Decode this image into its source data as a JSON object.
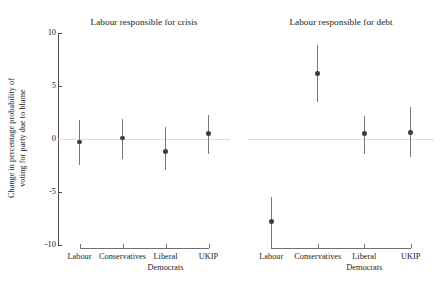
{
  "chart_data": {
    "type": "scatter",
    "title": "",
    "ylabel_lines": [
      "Change in percentage probability of",
      "voting for party due to blame"
    ],
    "ylabel": "Change in percentage probability of voting for party due to blame",
    "xlabel": "",
    "ylim": [
      -10,
      10
    ],
    "yticks": [
      10,
      5,
      0,
      -5,
      -10
    ],
    "ytick_labels": [
      "10",
      "5",
      "0",
      "-5",
      "-10"
    ],
    "grid": false,
    "legend": "none",
    "zero_reference_line": 0,
    "error_bar_style": "vertical-95ci",
    "categories": [
      "Labour",
      "Conservatives",
      "Liberal Democrats",
      "UKIP"
    ],
    "category_label_lines": [
      [
        "Labour"
      ],
      [
        "Conservatives"
      ],
      [
        "Liberal",
        "Democrats"
      ],
      [
        "UKIP"
      ]
    ],
    "panels": [
      {
        "title": "Labour responsible for crisis",
        "points": [
          {
            "category": "Labour",
            "value": -0.3,
            "ci_low": -2.5,
            "ci_high": 1.8
          },
          {
            "category": "Conservatives",
            "value": 0.1,
            "ci_low": -1.9,
            "ci_high": 1.9
          },
          {
            "category": "Liberal Democrats",
            "value": -1.2,
            "ci_low": -2.9,
            "ci_high": 1.1
          },
          {
            "category": "UKIP",
            "value": 0.5,
            "ci_low": -1.4,
            "ci_high": 2.3
          }
        ]
      },
      {
        "title": "Labour responsible for debt",
        "points": [
          {
            "category": "Labour",
            "value": -7.8,
            "ci_low": -10.0,
            "ci_high": -5.5
          },
          {
            "category": "Conservatives",
            "value": 6.2,
            "ci_low": 3.5,
            "ci_high": 8.9
          },
          {
            "category": "Liberal Democrats",
            "value": 0.5,
            "ci_low": -1.4,
            "ci_high": 2.2
          },
          {
            "category": "UKIP",
            "value": 0.6,
            "ci_low": -1.7,
            "ci_high": 3.0
          }
        ]
      }
    ],
    "colors": {
      "point": "#3d3d3d",
      "error_bar": "#777777",
      "axis": "#4a4a4a",
      "zero_line": "#dcdcdc",
      "background": "#ffffff",
      "text": "#1a1a1a"
    }
  }
}
